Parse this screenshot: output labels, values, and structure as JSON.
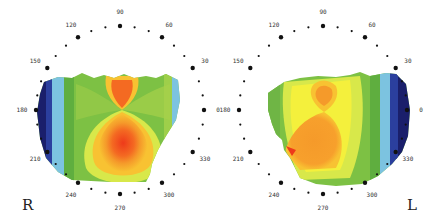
{
  "chart_data": {
    "type": "heatmap",
    "plots": [
      {
        "eye_label": "R",
        "center": [
          120,
          110
        ],
        "angle_labels": [
          "0",
          "30",
          "60",
          "90",
          "120",
          "150",
          "180",
          "210",
          "240",
          "270",
          "300",
          "330"
        ],
        "pattern": "asymmetric bowtie, steep (red) inferior lobe larger than superior lobe; flatter blue periphery nasally/temporally at 180"
      },
      {
        "eye_label": "L",
        "center": [
          323,
          110
        ],
        "angle_labels": [
          "0",
          "30",
          "60",
          "90",
          "120",
          "150",
          "180",
          "210",
          "240",
          "270",
          "300",
          "330"
        ],
        "pattern": "asymmetric bowtie, orange inferior lobe larger than superior lobe; blue periphery at 0"
      }
    ],
    "color_scale": [
      "#1a1f6b",
      "#2b3f9e",
      "#5aa9dc",
      "#7cc3e0",
      "#5fae3f",
      "#7dc144",
      "#a6d04a",
      "#d8e84a",
      "#f4f03c",
      "#f8c232",
      "#f59a2a",
      "#f46a22",
      "#ee3a1a"
    ]
  },
  "labels": {
    "right_eye": "R",
    "left_eye": "L"
  }
}
